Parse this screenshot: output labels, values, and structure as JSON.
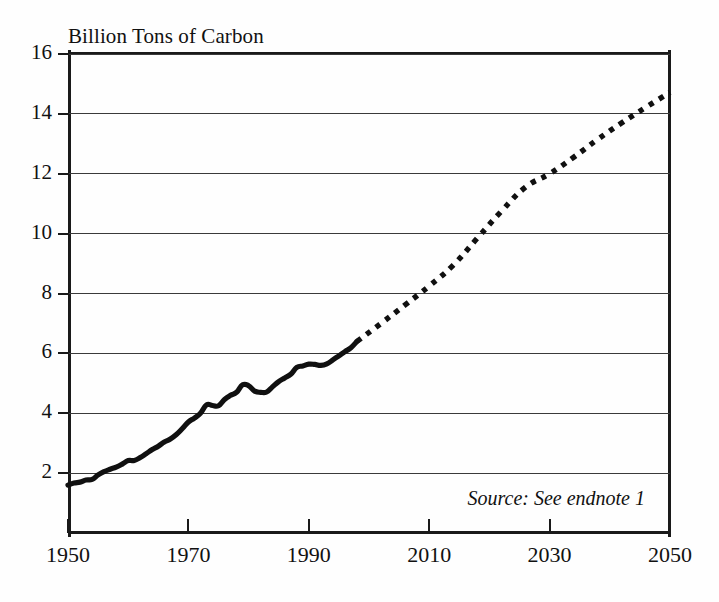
{
  "chart_data": {
    "type": "line",
    "title": "Billion Tons of Carbon",
    "xlabel": "",
    "ylabel": "Billion Tons of Carbon",
    "xlim": [
      1950,
      2050
    ],
    "ylim": [
      0,
      16
    ],
    "xticks": [
      1950,
      1970,
      1990,
      2010,
      2030,
      2050
    ],
    "yticks": [
      2,
      4,
      6,
      8,
      10,
      12,
      14,
      16
    ],
    "grid": "horizontal",
    "legend": "none",
    "annotations": [
      "Source: See endnote 1"
    ],
    "series": [
      {
        "name": "Historical carbon emissions",
        "style": "solid",
        "x": [
          1950,
          1951,
          1952,
          1953,
          1954,
          1955,
          1956,
          1957,
          1958,
          1959,
          1960,
          1961,
          1962,
          1963,
          1964,
          1965,
          1966,
          1967,
          1968,
          1969,
          1970,
          1971,
          1972,
          1973,
          1974,
          1975,
          1976,
          1977,
          1978,
          1979,
          1980,
          1981,
          1982,
          1983,
          1984,
          1985,
          1986,
          1987,
          1988,
          1989,
          1990,
          1991,
          1992,
          1993,
          1994,
          1995,
          1996,
          1997,
          1998
        ],
        "values": [
          1.6,
          1.67,
          1.7,
          1.77,
          1.79,
          1.94,
          2.05,
          2.13,
          2.2,
          2.3,
          2.42,
          2.42,
          2.52,
          2.65,
          2.79,
          2.9,
          3.04,
          3.14,
          3.29,
          3.49,
          3.71,
          3.84,
          4.0,
          4.28,
          4.26,
          4.25,
          4.46,
          4.6,
          4.7,
          4.95,
          4.92,
          4.74,
          4.7,
          4.71,
          4.89,
          5.06,
          5.18,
          5.3,
          5.53,
          5.58,
          5.64,
          5.63,
          5.6,
          5.65,
          5.78,
          5.92,
          6.06,
          6.19,
          6.4
        ]
      },
      {
        "name": "Projected carbon emissions",
        "style": "dotted",
        "x": [
          1998,
          2002,
          2006,
          2010,
          2014,
          2018,
          2022,
          2026,
          2030,
          2034,
          2038,
          2042,
          2046,
          2050
        ],
        "values": [
          6.4,
          7.0,
          7.62,
          8.25,
          8.95,
          9.85,
          10.75,
          11.55,
          12.0,
          12.55,
          13.15,
          13.7,
          14.22,
          14.72
        ]
      }
    ]
  },
  "axes": {
    "y_labels": [
      "16",
      "14",
      "12",
      "10",
      "8",
      "6",
      "4",
      "2"
    ],
    "x_labels": [
      "1950",
      "1970",
      "1990",
      "2010",
      "2030",
      "2050"
    ]
  },
  "notes": {
    "source": "Source: See endnote 1"
  }
}
